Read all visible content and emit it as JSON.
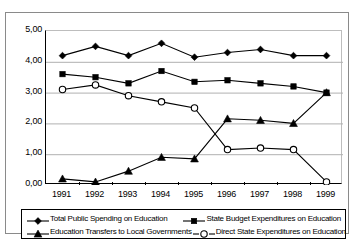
{
  "chart_data": {
    "type": "line",
    "title": "",
    "xlabel": "",
    "ylabel": "",
    "grid": true,
    "legend_position": "bottom",
    "categories": [
      "1991",
      "1992",
      "1993",
      "1994",
      "1995",
      "1996",
      "1997",
      "1998",
      "1999"
    ],
    "ylim": [
      0,
      5
    ],
    "ytick_labels": [
      "0,00",
      "1,00",
      "2,00",
      "3,00",
      "4,00",
      "5,00"
    ],
    "ytick_values": [
      0,
      1,
      2,
      3,
      4,
      5
    ],
    "series": [
      {
        "name": "Total Public Spending on Education",
        "marker": "filled-diamond",
        "values": [
          4.2,
          4.5,
          4.2,
          4.6,
          4.15,
          4.3,
          4.4,
          4.2,
          4.2
        ]
      },
      {
        "name": "State Budget Expenditures on Education",
        "marker": "filled-square",
        "values": [
          3.6,
          3.5,
          3.3,
          3.7,
          3.35,
          3.4,
          3.3,
          3.2,
          3.0
        ]
      },
      {
        "name": "Education Transfers to Local Governments",
        "marker": "filled-triangle",
        "values": [
          0.2,
          0.1,
          0.45,
          0.9,
          0.85,
          2.15,
          2.1,
          2.0,
          3.0
        ]
      },
      {
        "name": "Direct State Expenditures on Education",
        "marker": "open-circle",
        "values": [
          3.1,
          3.25,
          2.9,
          2.7,
          2.5,
          1.15,
          1.2,
          1.15,
          0.1
        ]
      }
    ]
  },
  "legend": {
    "rows": [
      [
        {
          "label": "Total Public Spending on Education",
          "marker": "filled-diamond"
        },
        {
          "label": "State Budget Expenditures on Education",
          "marker": "filled-square"
        }
      ],
      [
        {
          "label": "Education Transfers to Local Governments",
          "marker": "filled-triangle"
        },
        {
          "label": "Direct State Expenditures on Education",
          "marker": "open-circle"
        }
      ]
    ]
  },
  "colors": {
    "line": "#000000",
    "grid": "#b0b0b0",
    "axis": "#000000",
    "frame": "#8a8a8a",
    "background": "#ffffff"
  }
}
